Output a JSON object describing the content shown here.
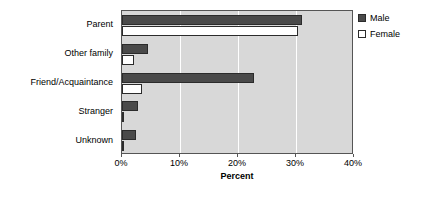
{
  "chart_data": {
    "type": "bar",
    "orientation": "horizontal",
    "title": "",
    "xlabel": "Percent",
    "ylabel": "",
    "categories": [
      "Parent",
      "Other family",
      "Friend/Acquaintance",
      "Stranger",
      "Unknown"
    ],
    "series": [
      {
        "name": "Male",
        "color": "#4a4a4a",
        "values": [
          31.0,
          4.5,
          22.8,
          2.8,
          2.4
        ]
      },
      {
        "name": "Female",
        "color": "#ffffff",
        "values": [
          30.3,
          2.1,
          3.5,
          0.2,
          0.4
        ]
      }
    ],
    "xlim": [
      0,
      40
    ],
    "xticks": [
      0,
      10,
      20,
      30,
      40
    ],
    "xtick_labels": [
      "0%",
      "10%",
      "20%",
      "30%",
      "40%"
    ],
    "grid": true,
    "grid_axis": "x",
    "legend": {
      "position": "right-top",
      "entries": [
        "Male",
        "Female"
      ]
    },
    "plot_background": "#d8d8d8",
    "figure_background": "#ffffff",
    "axis_color": "#555555"
  }
}
